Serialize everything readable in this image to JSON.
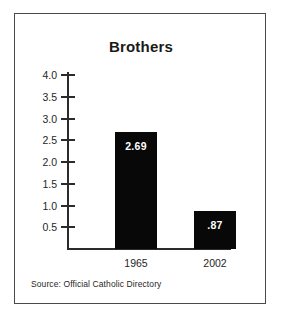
{
  "figure": {
    "title": "Brothers",
    "source_note": "Source: Official Catholic Directory",
    "frame_color": "#4a4a4a",
    "background_color": "#ffffff",
    "bar_color": "#080808",
    "bar_label_color": "#ffffff",
    "axis_color": "#2b2b2b"
  },
  "chart_data": {
    "type": "bar",
    "title": "Brothers",
    "xlabel": "",
    "ylabel": "",
    "categories": [
      "1965",
      "2002"
    ],
    "values": [
      2.69,
      0.87
    ],
    "value_labels": [
      "2.69",
      ".87"
    ],
    "ylim": [
      0,
      4.0
    ],
    "yticks": [
      0.5,
      1.0,
      1.5,
      2.0,
      2.5,
      3.0,
      3.5,
      4.0
    ],
    "ytick_labels": [
      "0.5",
      "1.0",
      "1.5",
      "2.0",
      "2.5",
      "3.0",
      "3.5",
      "4.0"
    ],
    "grid": false,
    "legend": false,
    "annotations": [
      "Source: Official Catholic Directory"
    ],
    "series": [
      {
        "name": "Brothers",
        "values": [
          2.69,
          0.87
        ]
      }
    ]
  }
}
